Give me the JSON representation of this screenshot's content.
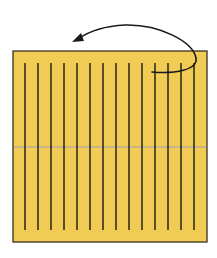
{
  "diagram": {
    "type": "origami-fold-step",
    "colors": {
      "paper": "#f0cc55",
      "paper_edge": "#3a3020",
      "pleat_line": "#2a2418",
      "center_crease": "#a898b8",
      "arrow": "#1a1a1a",
      "background": "#ffffff"
    },
    "sheet": {
      "x": 13,
      "y": 51,
      "width": 194,
      "height": 191
    },
    "pleat_lines": {
      "count": 14,
      "x_positions": [
        25,
        38,
        51,
        64,
        77,
        90,
        103,
        116,
        129,
        142,
        155,
        168,
        181,
        194
      ],
      "y_start": 63,
      "y_end": 230
    },
    "center_crease": {
      "y": 147
    },
    "arrow": {
      "label": "fold direction",
      "path": "M152 72 C 175 74, 198 70, 196 58 C 193 42, 160 24, 125 25 C 105 26, 88 32, 78 39",
      "head": {
        "tip_x": 72,
        "tip_y": 42
      }
    }
  }
}
